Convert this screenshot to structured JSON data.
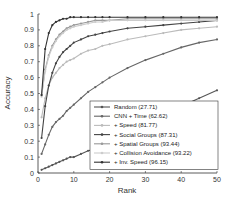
{
  "chart_data": {
    "type": "line",
    "title": "",
    "xlabel": "Rank",
    "ylabel": "Accuracy",
    "xlim": [
      0,
      50
    ],
    "ylim": [
      0,
      1
    ],
    "xticks": [
      0,
      10,
      20,
      30,
      40,
      50
    ],
    "yticks": [
      0,
      0.1,
      0.2,
      0.3,
      0.4,
      0.5,
      0.6,
      0.7,
      0.8,
      0.9,
      1
    ],
    "ytick_labels": [
      "0",
      "0.1",
      "0.2",
      "0.3",
      "0.4",
      "0.5",
      "0.6",
      "0.7",
      "0.8",
      "0.9",
      "1"
    ],
    "grid": false,
    "legend_position": "lower right",
    "x": [
      1,
      2,
      3,
      4,
      5,
      6,
      7,
      8,
      9,
      10,
      12,
      14,
      16,
      18,
      20,
      25,
      30,
      35,
      40,
      45,
      50
    ],
    "series": [
      {
        "name": "Random (27.71)",
        "color": "#555555",
        "values": [
          0.02,
          0.03,
          0.04,
          0.05,
          0.06,
          0.07,
          0.08,
          0.09,
          0.1,
          0.1,
          0.12,
          0.14,
          0.15,
          0.17,
          0.19,
          0.25,
          0.3,
          0.36,
          0.42,
          0.47,
          0.52
        ]
      },
      {
        "name": "CNN + Time (62.62)",
        "color": "#666666",
        "values": [
          0.12,
          0.18,
          0.24,
          0.29,
          0.32,
          0.34,
          0.36,
          0.39,
          0.41,
          0.43,
          0.47,
          0.51,
          0.54,
          0.57,
          0.6,
          0.66,
          0.71,
          0.75,
          0.79,
          0.82,
          0.84
        ]
      },
      {
        "name": "+ Speed (81.77)",
        "color": "#bbbbbb",
        "values": [
          0.35,
          0.47,
          0.55,
          0.6,
          0.63,
          0.66,
          0.68,
          0.7,
          0.71,
          0.72,
          0.75,
          0.77,
          0.78,
          0.8,
          0.81,
          0.84,
          0.86,
          0.88,
          0.9,
          0.91,
          0.92
        ]
      },
      {
        "name": "+ Social Groups (87.31)",
        "color": "#444444",
        "values": [
          0.22,
          0.42,
          0.55,
          0.63,
          0.69,
          0.73,
          0.76,
          0.78,
          0.8,
          0.82,
          0.84,
          0.86,
          0.87,
          0.88,
          0.89,
          0.91,
          0.92,
          0.93,
          0.94,
          0.95,
          0.96
        ]
      },
      {
        "name": "+ Spatial Groups (93.44)",
        "color": "#999999",
        "values": [
          0.49,
          0.65,
          0.74,
          0.8,
          0.84,
          0.87,
          0.89,
          0.91,
          0.92,
          0.93,
          0.94,
          0.95,
          0.96,
          0.96,
          0.96,
          0.97,
          0.97,
          0.97,
          0.97,
          0.97,
          0.97
        ]
      },
      {
        "name": "+ Collision Avoidance (93.22)",
        "color": "#cccccc",
        "values": [
          0.48,
          0.64,
          0.73,
          0.79,
          0.83,
          0.86,
          0.88,
          0.9,
          0.91,
          0.92,
          0.93,
          0.94,
          0.95,
          0.95,
          0.96,
          0.96,
          0.96,
          0.96,
          0.96,
          0.96,
          0.96
        ]
      },
      {
        "name": "+ Inv. Speed (96.15)",
        "color": "#333333",
        "values": [
          0.49,
          0.78,
          0.88,
          0.93,
          0.95,
          0.96,
          0.97,
          0.97,
          0.98,
          0.98,
          0.98,
          0.98,
          0.98,
          0.98,
          0.98,
          0.98,
          0.98,
          0.98,
          0.98,
          0.98,
          0.98
        ]
      }
    ]
  }
}
